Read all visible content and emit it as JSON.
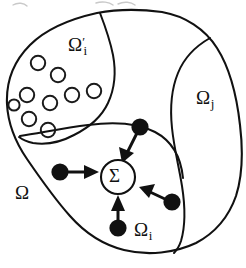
{
  "figure": {
    "kind": "domain-decomposition-diagram",
    "width": 246,
    "height": 268,
    "background_color": "#ffffff",
    "ink_color": "#111111"
  },
  "labels": {
    "outer_domain": {
      "omega": "Ω"
    },
    "inclusion_subregion": {
      "omega": "Ω",
      "prime": "′",
      "subscript": "i"
    },
    "neighbour_subregion": {
      "omega": "Ω",
      "subscript": "j"
    },
    "local_subregion": {
      "omega": "Ω",
      "subscript": "i"
    },
    "summation_node": {
      "text": "Σ"
    }
  },
  "regions": [
    {
      "name": "outer-domain",
      "label": "Ω",
      "label_position": {
        "x": 15,
        "y": 183
      }
    },
    {
      "name": "inclusion-subregion",
      "label": "Ω′i",
      "label_position": {
        "x": 68,
        "y": 35
      },
      "inclusion_count": 9
    },
    {
      "name": "neighbour-subregion",
      "label": "Ωj",
      "label_position": {
        "x": 196,
        "y": 88
      }
    },
    {
      "name": "local-subregion",
      "label": "Ωi",
      "label_position": {
        "x": 134,
        "y": 220
      }
    }
  ],
  "inclusions": [
    {
      "cx": 38,
      "cy": 63,
      "r": 7.2
    },
    {
      "cx": 58,
      "cy": 75,
      "r": 7.2
    },
    {
      "cx": 27,
      "cy": 95,
      "r": 7.2
    },
    {
      "cx": 50,
      "cy": 103,
      "r": 7.2
    },
    {
      "cx": 72,
      "cy": 95,
      "r": 7.2
    },
    {
      "cx": 94,
      "cy": 91,
      "r": 7.2
    },
    {
      "cx": 29,
      "cy": 119,
      "r": 7.2
    },
    {
      "cx": 48,
      "cy": 130,
      "r": 7.2
    },
    {
      "cx": 14,
      "cy": 105,
      "r": 5.6
    }
  ],
  "summation_node": {
    "text": "Σ",
    "cx": 118,
    "cy": 177,
    "r": 17
  },
  "flux_arrows": [
    {
      "name": "arrow-from-top-source",
      "dot": {
        "cx": 140,
        "cy": 127,
        "r": 8.5
      },
      "from": {
        "x": 135,
        "y": 134
      },
      "to": {
        "x": 124,
        "y": 159
      }
    },
    {
      "name": "arrow-from-left-source",
      "dot": {
        "cx": 60,
        "cy": 172,
        "r": 8.5
      },
      "from": {
        "x": 69,
        "y": 172
      },
      "to": {
        "x": 98,
        "y": 173
      }
    },
    {
      "name": "arrow-from-right-source",
      "dot": {
        "cx": 172,
        "cy": 202,
        "r": 8.5
      },
      "from": {
        "x": 164,
        "y": 199
      },
      "to": {
        "x": 140,
        "y": 188
      }
    },
    {
      "name": "arrow-from-bottom-source",
      "dot": {
        "cx": 118,
        "cy": 228,
        "r": 8.5
      },
      "from": {
        "x": 118,
        "y": 220
      },
      "to": {
        "x": 118,
        "y": 197
      }
    }
  ]
}
